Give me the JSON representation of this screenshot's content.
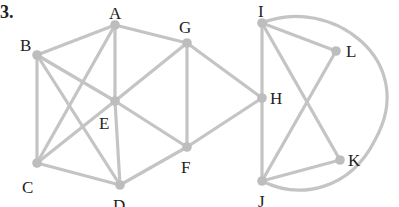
{
  "figure": {
    "number_label": "3.",
    "edge_color": "#c4c4c4",
    "node_color": "#bdbdbd",
    "label_color": "#222222"
  },
  "nodes": [
    {
      "id": "A",
      "label": "A",
      "x": 115,
      "y": 25
    },
    {
      "id": "B",
      "label": "B",
      "x": 37,
      "y": 55
    },
    {
      "id": "C",
      "label": "C",
      "x": 37,
      "y": 163
    },
    {
      "id": "D",
      "label": "D",
      "x": 120,
      "y": 185
    },
    {
      "id": "E",
      "label": "E",
      "x": 115,
      "y": 101
    },
    {
      "id": "F",
      "label": "F",
      "x": 187,
      "y": 147
    },
    {
      "id": "G",
      "label": "G",
      "x": 187,
      "y": 43
    },
    {
      "id": "H",
      "label": "H",
      "x": 262,
      "y": 98
    },
    {
      "id": "I",
      "label": "I",
      "x": 262,
      "y": 23
    },
    {
      "id": "J",
      "label": "J",
      "x": 262,
      "y": 181
    },
    {
      "id": "K",
      "label": "K",
      "x": 340,
      "y": 160
    },
    {
      "id": "L",
      "label": "L",
      "x": 336,
      "y": 51
    }
  ],
  "edges": [
    [
      "A",
      "B"
    ],
    [
      "A",
      "G"
    ],
    [
      "A",
      "E"
    ],
    [
      "A",
      "C"
    ],
    [
      "B",
      "C"
    ],
    [
      "B",
      "E"
    ],
    [
      "B",
      "D"
    ],
    [
      "C",
      "E"
    ],
    [
      "C",
      "D"
    ],
    [
      "D",
      "E"
    ],
    [
      "D",
      "F"
    ],
    [
      "E",
      "G"
    ],
    [
      "E",
      "F"
    ],
    [
      "G",
      "F"
    ],
    [
      "G",
      "H"
    ],
    [
      "F",
      "H"
    ],
    [
      "H",
      "I"
    ],
    [
      "H",
      "J"
    ],
    [
      "I",
      "L"
    ],
    [
      "I",
      "K"
    ],
    [
      "L",
      "J"
    ],
    [
      "J",
      "K"
    ]
  ],
  "curved_edges": [
    {
      "from": "I",
      "to": "J",
      "side": "right"
    }
  ]
}
